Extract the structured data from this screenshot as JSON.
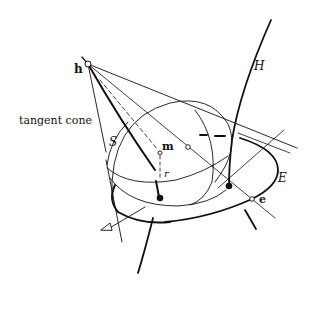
{
  "figure": {
    "labels": {
      "h": "h",
      "H": "H",
      "tangent_cone": "tangent cone",
      "S": "S",
      "m": "m",
      "r": "r",
      "E": "E",
      "e": "e"
    },
    "colors": {
      "ink": "#111111",
      "background": "#ffffff"
    }
  }
}
